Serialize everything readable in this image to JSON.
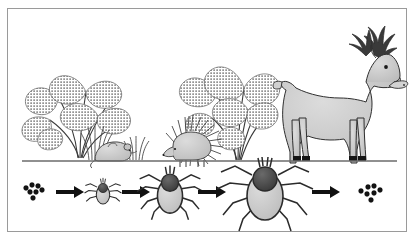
{
  "figure": {
    "width": 415,
    "height": 241,
    "background_color": "#ffffff",
    "border_color": "#9a9a9a"
  },
  "palette": {
    "outline": "#2b2b2b",
    "animal_fill": "#c9c9c9",
    "animal_fill_light": "#d4d4d4",
    "vegetation_fill": "#b5b5b5",
    "vegetation_stipple": "#6e6e6e",
    "tick_body": "#b0b0b0",
    "tick_scutum": "#4a4a4a",
    "egg_fill": "#1a1a1a",
    "arrow_fill": "#111111",
    "ground_line": "#6b6b6b",
    "hoof_fill": "#1a1a1a",
    "antler_fill": "#3a3a3a"
  },
  "scene": {
    "ground_line_label": "ground-line",
    "habitat": {
      "label": "habitat-band",
      "plants": [
        {
          "name": "fern-cluster-left",
          "x": 74,
          "y": 112,
          "scale": 1.0
        },
        {
          "name": "grass-tuft-left",
          "x": 103,
          "y": 157,
          "scale": 1.0
        },
        {
          "name": "grass-tuft-mid",
          "x": 140,
          "y": 157,
          "scale": 0.8
        },
        {
          "name": "fern-cluster-right",
          "x": 232,
          "y": 105,
          "scale": 1.05
        }
      ],
      "hosts": [
        {
          "name": "mouse",
          "label": "mouse-host",
          "x": 110,
          "y": 154
        },
        {
          "name": "hedgehog",
          "label": "hedgehog-host",
          "x": 185,
          "y": 150
        },
        {
          "name": "deer",
          "label": "deer-host",
          "x": 300,
          "y": 160
        }
      ]
    },
    "lifecycle": {
      "label": "tick-life-cycle-row",
      "baseline_y": 192,
      "stages": [
        {
          "id": "eggs-start",
          "name": "tick-eggs",
          "label": "Eggs",
          "x": 34,
          "y": 192,
          "kind": "eggs",
          "egg_count": 7
        },
        {
          "id": "larva",
          "name": "tick-larva",
          "label": "Larva",
          "x": 103,
          "y": 193,
          "kind": "tick",
          "scale": 0.42
        },
        {
          "id": "nymph",
          "name": "tick-nymph",
          "label": "Nymph",
          "x": 170,
          "y": 192,
          "kind": "tick",
          "scale": 0.66
        },
        {
          "id": "adult",
          "name": "tick-adult",
          "label": "Adult",
          "x": 265,
          "y": 191,
          "kind": "tick",
          "scale": 1.0
        },
        {
          "id": "eggs-end",
          "name": "tick-eggs",
          "label": "Eggs",
          "x": 379,
          "y": 192,
          "kind": "eggs",
          "egg_count": 7
        }
      ],
      "arrows": [
        {
          "name": "arrow-eggs-to-larva",
          "x": 62,
          "y": 192,
          "length": 26
        },
        {
          "name": "arrow-larva-to-nymph",
          "x": 128,
          "y": 192,
          "length": 26
        },
        {
          "name": "arrow-nymph-to-adult",
          "x": 205,
          "y": 192,
          "length": 26
        },
        {
          "name": "arrow-adult-to-eggs",
          "x": 320,
          "y": 192,
          "length": 26
        }
      ]
    }
  }
}
